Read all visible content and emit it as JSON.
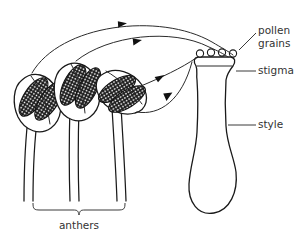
{
  "diagram": {
    "background_color": "#ffffff",
    "ink_color": "#1a1a1a",
    "text_color": "#333333"
  },
  "labels": {
    "pollen_grains_line1": "pollen",
    "pollen_grains_line2": "grains",
    "stigma": "stigma",
    "style": "style",
    "anthers": "anthers"
  },
  "structures": {
    "anther_count": 3,
    "pollen_grain_count": 4,
    "arrow_count": 4,
    "filament_count": 3,
    "pistil_parts": [
      "stigma",
      "style",
      "ovary"
    ]
  }
}
